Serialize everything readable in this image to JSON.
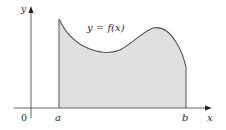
{
  "diagram": {
    "type": "area-under-curve",
    "curve_label": "y = f(x)",
    "axes": {
      "x_label": "x",
      "y_label": "y",
      "origin_label": "0"
    },
    "bounds": {
      "left_label": "a",
      "right_label": "b"
    },
    "colors": {
      "fill": "#e0e0e0",
      "curve": "#555555",
      "axis": "#555555",
      "text": "#2a2a2a",
      "background": "#ffffff"
    }
  }
}
